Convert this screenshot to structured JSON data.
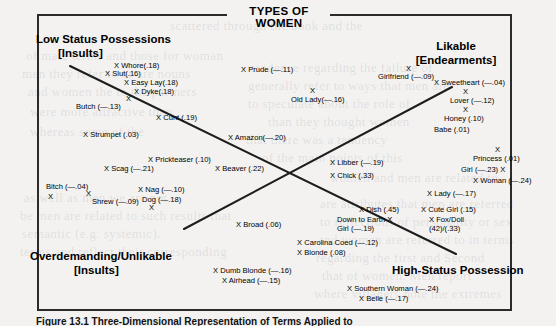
{
  "figure": {
    "title": "TYPES OF WOMEN",
    "caption": "Figure 13.1  Three-Dimensional Representation of Terms Applied to"
  },
  "regions": [
    {
      "name": "low-status-possessions",
      "line1": "Low Status Possessions",
      "line2": "[Insults]"
    },
    {
      "name": "likable",
      "line1": "Likable",
      "line2": "[Endearments]"
    },
    {
      "name": "overdemanding-unlikable",
      "line1": "Overdemanding/Unlikable",
      "line2": "[Insults]"
    },
    {
      "name": "high-status-possession",
      "line1": "High-Status Possession",
      "line2": ""
    }
  ],
  "axes": [
    {
      "name": "axis-lowstatus-highstatus",
      "x1": 70,
      "y1": 66,
      "x2": 456,
      "y2": 254
    },
    {
      "name": "axis-overdemanding-likable",
      "x1": 184,
      "y1": 229,
      "x2": 452,
      "y2": 87
    }
  ],
  "chart_data": {
    "type": "scatter",
    "title": "TYPES OF WOMEN",
    "xlabel": "",
    "ylabel": "",
    "grid": false,
    "legend": "none",
    "axis_poles": [
      "Low Status Possessions [Insults]",
      "Likable [Endearments]",
      "Overdemanding/Unlikable [Insults]",
      "High-Status Possession"
    ],
    "points": [
      {
        "label": "Whore",
        "value": ".18",
        "text": "X Whore(.18)",
        "x": 114,
        "y": 62
      },
      {
        "label": "Slut",
        "value": ".16",
        "text": "X Slut(.16)",
        "x": 105,
        "y": 70
      },
      {
        "label": "Easy Lay",
        "value": ".18",
        "text": "X Easy Lay(.18)",
        "x": 124,
        "y": 79
      },
      {
        "label": "Dyke",
        "value": ".18",
        "text": "X Dyke(.18)",
        "x": 134,
        "y": 88
      },
      {
        "label": "Butch",
        "value": "-.13",
        "text": "Butch (—.13)",
        "x": 76,
        "y": 103,
        "marker": "X",
        "mx": 126,
        "my": 95
      },
      {
        "label": "Cunt",
        "value": ".19",
        "text": "X Cunt (.19)",
        "x": 156,
        "y": 114
      },
      {
        "label": "Prude",
        "value": "-.11",
        "text": "X Prude (—.11)",
        "x": 241,
        "y": 66
      },
      {
        "label": "Old Lady",
        "value": "-.16",
        "text": "Old Lady(—.16)",
        "x": 291,
        "y": 96,
        "marker": "X",
        "mx": 310,
        "my": 87
      },
      {
        "label": "Girlfriend",
        "value": "-.09",
        "text": "Girlfriend (—.09)",
        "x": 378,
        "y": 73,
        "marker": "X",
        "mx": 406,
        "my": 65
      },
      {
        "label": "Sweetheart",
        "value": "-.04",
        "text": "X Sweetheart (—.04)",
        "x": 434,
        "y": 79
      },
      {
        "label": "Lover",
        "value": "-.12",
        "text": "Lover (—.12)",
        "x": 450,
        "y": 97,
        "marker": "X",
        "mx": 463,
        "my": 88
      },
      {
        "label": "Honey",
        "value": ".10",
        "text": "Honey (.10)",
        "x": 444,
        "y": 115,
        "marker": "X",
        "mx": 463,
        "my": 106
      },
      {
        "label": "Babe",
        "value": ".01",
        "text": "Babe (.01)",
        "x": 434,
        "y": 126
      },
      {
        "label": "Strumpet",
        "value": ".03",
        "text": "X Strumpet (.03)",
        "x": 83,
        "y": 131
      },
      {
        "label": "Amazon",
        "value": "-.20",
        "text": "X Amazon(—.20)",
        "x": 228,
        "y": 134
      },
      {
        "label": "Prickteaser",
        "value": ".10",
        "text": "X Prickteaser (.10)",
        "x": 148,
        "y": 156
      },
      {
        "label": "Scag",
        "value": "-.21",
        "text": "X Scag (—.21)",
        "x": 104,
        "y": 165
      },
      {
        "label": "Beaver",
        "value": ".22",
        "text": "X Beaver (.22)",
        "x": 215,
        "y": 165
      },
      {
        "label": "Libber",
        "value": "-.19",
        "text": "X Libber (—.19)",
        "x": 330,
        "y": 159
      },
      {
        "label": "Chick",
        "value": ".33",
        "text": "X Chick (.33)",
        "x": 330,
        "y": 172
      },
      {
        "label": "Princess",
        "value": ".01",
        "text": "Princess (.01)",
        "x": 473,
        "y": 155,
        "marker": "X",
        "mx": 495,
        "my": 146
      },
      {
        "label": "Girl",
        "value": "-.23",
        "text": "Girl (—.23) X",
        "x": 461,
        "y": 166
      },
      {
        "label": "Woman",
        "value": "-.24",
        "text": "X Woman (—.24)",
        "x": 473,
        "y": 177
      },
      {
        "label": "Bitch",
        "value": "-.04",
        "text": "Bitch (—.04)",
        "x": 46,
        "y": 183,
        "marker": "X",
        "mx": 48,
        "my": 193
      },
      {
        "label": "Nag",
        "value": "-.10",
        "text": "X Nag (—.10)",
        "x": 138,
        "y": 186
      },
      {
        "label": "Shrew",
        "value": "-.09",
        "text": "Shrew (—.09)",
        "x": 92,
        "y": 198,
        "marker": "X",
        "mx": 86,
        "my": 190
      },
      {
        "label": "Dog",
        "value": "-.18",
        "text": "Dog (—.18)",
        "x": 142,
        "y": 196,
        "marker": "X",
        "mx": 149,
        "my": 204
      },
      {
        "label": "Lady",
        "value": "-.17",
        "text": "X Lady (—.17)",
        "x": 427,
        "y": 190
      },
      {
        "label": "Dish",
        "value": ".45",
        "text": "X Dish (.45)",
        "x": 359,
        "y": 206
      },
      {
        "label": "Cute Girl",
        "value": ".15",
        "text": "X Cute Girl (.15)",
        "x": 421,
        "y": 206
      },
      {
        "label": "Down to Earth Girl",
        "value": "-.19",
        "text": "Down to Earth X",
        "x": 337,
        "y": 216,
        "text2": "Girl  (—.19)"
      },
      {
        "label": "Fox/Doll",
        "value": "(.42)/(.33)",
        "text": "X Fox/Doll",
        "x": 429,
        "y": 216,
        "text2": "(42)/(.33)"
      },
      {
        "label": "Broad",
        "value": ".06",
        "text": "X Broad (.06)",
        "x": 236,
        "y": 221
      },
      {
        "label": "Carolina Coed",
        "value": "-.12",
        "text": "X Carolina Coed (—.12)",
        "x": 297,
        "y": 239
      },
      {
        "label": "Blonde",
        "value": ".08",
        "text": "X Blonde (.08)",
        "x": 297,
        "y": 249
      },
      {
        "label": "Dumb Blonde",
        "value": "-.16",
        "text": "X Dumb Blonde (—.16)",
        "x": 213,
        "y": 267
      },
      {
        "label": "Airhead",
        "value": "-.15",
        "text": "X Airhead (—.15)",
        "x": 222,
        "y": 277
      },
      {
        "label": "Southern Woman",
        "value": "-.24",
        "text": "X Southern Woman (—.24)",
        "x": 347,
        "y": 285
      },
      {
        "label": "Belle",
        "value": "-.17",
        "text": "X Belle (—.17)",
        "x": 359,
        "y": 295
      }
    ]
  },
  "bleed_text": [
    {
      "t": "scattered through the book and the",
      "x": 170,
      "y": 18
    },
    {
      "t": "of male terms and those for woman",
      "x": 26,
      "y": 48
    },
    {
      "t": "men they refer to or are nouns",
      "x": 22,
      "y": 66
    },
    {
      "t": "and women the to the partners",
      "x": 28,
      "y": 84
    },
    {
      "t": "evidence regarding the failure of",
      "x": 250,
      "y": 60
    },
    {
      "t": "generally refer to ways that men are",
      "x": 248,
      "y": 78
    },
    {
      "t": "to speculate about the role of",
      "x": 248,
      "y": 96
    },
    {
      "t": "than they thought women",
      "x": 268,
      "y": 114
    },
    {
      "t": "were more attractive than",
      "x": 30,
      "y": 104
    },
    {
      "t": "whereas some of the",
      "x": 30,
      "y": 124
    },
    {
      "t": "that there was a tendency",
      "x": 246,
      "y": 132
    },
    {
      "t": "of the main points of this",
      "x": 262,
      "y": 150
    },
    {
      "t": "as well as men we are not",
      "x": 24,
      "y": 190
    },
    {
      "t": "be men are related to such results that",
      "x": 20,
      "y": 208
    },
    {
      "t": "semantic (e.g. systemic).",
      "x": 22,
      "y": 226
    },
    {
      "t": "terms and reflect their corresponding",
      "x": 20,
      "y": 244
    },
    {
      "t": "women and men are related to",
      "x": 330,
      "y": 170
    },
    {
      "t": "are attributes that men are referred",
      "x": 320,
      "y": 196
    },
    {
      "t": "to reflections of personality or sex",
      "x": 320,
      "y": 214
    },
    {
      "t": "and women are referred to in terms",
      "x": 318,
      "y": 232
    },
    {
      "t": "regarding the first and Second",
      "x": 316,
      "y": 250
    },
    {
      "t": "that of women. Men report",
      "x": 322,
      "y": 268
    },
    {
      "t": "where villagers note the extremes",
      "x": 314,
      "y": 286
    }
  ]
}
